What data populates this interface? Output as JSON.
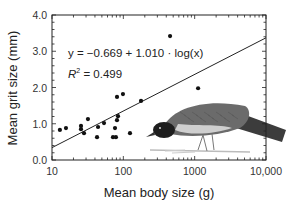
{
  "chart_data": {
    "type": "scatter",
    "title": "",
    "xlabel": "Mean body size (g)",
    "ylabel": "Mean grit size (mm)",
    "xscale": "log",
    "xlim": [
      10,
      10000
    ],
    "ylim": [
      0.0,
      4.0
    ],
    "x_ticks": [
      "10",
      "100",
      "1000",
      "10,000"
    ],
    "y_ticks": [
      "0.0",
      "1.0",
      "2.0",
      "3.0",
      "4.0"
    ],
    "grid": false,
    "legend": null,
    "annotations": {
      "equation": "y = −0.669 + 1.010 · log(x)",
      "r_squared_label": "R",
      "r_squared_value": "2 = 0.499"
    },
    "regression": {
      "intercept": -0.669,
      "slope": 1.01,
      "r2": 0.499,
      "transform": "log10(x)"
    },
    "points": [
      {
        "x": 12.9,
        "y": 0.83
      },
      {
        "x": 15.7,
        "y": 0.88
      },
      {
        "x": 25.5,
        "y": 0.94
      },
      {
        "x": 25.5,
        "y": 0.85
      },
      {
        "x": 28.1,
        "y": 0.74
      },
      {
        "x": 31.9,
        "y": 1.13
      },
      {
        "x": 42.8,
        "y": 0.63
      },
      {
        "x": 44.2,
        "y": 0.91
      },
      {
        "x": 53.6,
        "y": 1.02
      },
      {
        "x": 71.6,
        "y": 0.63
      },
      {
        "x": 76.4,
        "y": 0.88
      },
      {
        "x": 78.7,
        "y": 0.63
      },
      {
        "x": 81.5,
        "y": 1.1
      },
      {
        "x": 84.2,
        "y": 1.21
      },
      {
        "x": 81.5,
        "y": 1.74
      },
      {
        "x": 98.8,
        "y": 1.82
      },
      {
        "x": 124,
        "y": 0.74
      },
      {
        "x": 177,
        "y": 1.63
      },
      {
        "x": 452,
        "y": 3.42
      },
      {
        "x": 1117,
        "y": 1.98
      }
    ],
    "illustration": "bird pecking at ground (inset drawing, lower right)"
  }
}
